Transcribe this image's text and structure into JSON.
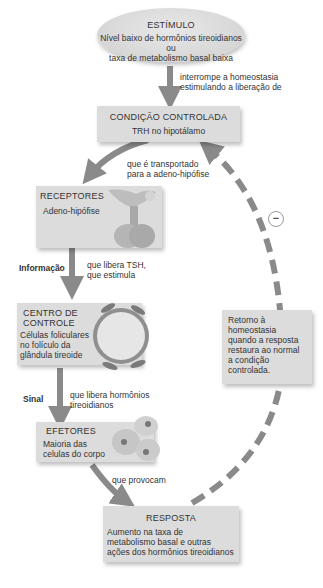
{
  "stimulus": {
    "title": "ESTÍMULO",
    "line1": "Nível baixo de hormônios tireoidianos ou",
    "line2": "taxa de metabolismo basal baixa"
  },
  "arrow1_label": {
    "line1": "interrompe a homeostasia",
    "line2": "estimulando a liberação de"
  },
  "controlled_condition": {
    "title": "CONDIÇÃO CONTROLADA",
    "text": "TRH no hipotálamo"
  },
  "arrow2_label": {
    "line1": "que é transportado",
    "line2": "para a adeno-hipófise"
  },
  "receptors": {
    "title": "RECEPTORES",
    "text": "Adeno-hipófise"
  },
  "arrow3_label": {
    "side": "Informação",
    "line1": "que libera TSH,",
    "line2": "que estimula"
  },
  "control_center": {
    "title1": "CENTRO DE",
    "title2": "CONTROLE",
    "line1": "Células foliculares",
    "line2": "no folículo da",
    "line3": "glândula tireoide"
  },
  "arrow4_label": {
    "side": "Sinal",
    "line1": "que libera hormônios",
    "line2": "tireoidianos"
  },
  "effectors": {
    "title": "EFETORES",
    "line1": "Maioria das",
    "line2": "celulas do corpo"
  },
  "arrow5_label": "que provocam",
  "response": {
    "title": "RESPOSTA",
    "line1": "Aumento na taxa de",
    "line2": "metabolismo basal e outras",
    "line3": "ações dos hormônios tireoidianos"
  },
  "feedback": {
    "symbol": "−",
    "line1": "Retorno à",
    "line2": "homeostasia",
    "line3": "quando a resposta",
    "line4": "restaura ao normal",
    "line5": "a condição",
    "line6": "controlada."
  },
  "colors": {
    "box": "#dcdcdc",
    "arrow": "#8a8a8a",
    "text": "#333333"
  }
}
